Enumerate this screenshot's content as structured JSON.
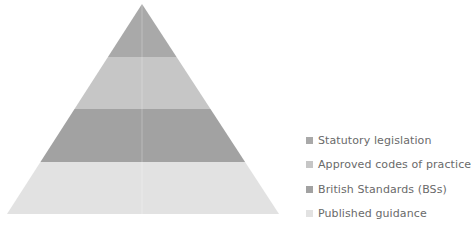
{
  "diagram": {
    "type": "pyramid",
    "apex": {
      "x": 142,
      "y": 4
    },
    "base": {
      "left": 7,
      "right": 279,
      "y": 214
    },
    "tiers": [
      {
        "label": "Statutory legislation",
        "color": "#a9a9a9",
        "y_top": 4,
        "y_bottom": 57
      },
      {
        "label": "Approved codes of practice",
        "color": "#c6c6c6",
        "y_top": 57,
        "y_bottom": 109
      },
      {
        "label": "British Standards (BSs)",
        "color": "#a2a2a2",
        "y_top": 109,
        "y_bottom": 162
      },
      {
        "label": "Published guidance",
        "color": "#e2e2e2",
        "y_top": 162,
        "y_bottom": 214
      }
    ]
  },
  "legend": {
    "items": [
      {
        "label": "Statutory legislation",
        "color": "#a9a9a9"
      },
      {
        "label": "Approved codes of practice",
        "color": "#c6c6c6"
      },
      {
        "label": "British Standards (BSs)",
        "color": "#a2a2a2"
      },
      {
        "label": "Published guidance",
        "color": "#e2e2e2"
      }
    ]
  }
}
